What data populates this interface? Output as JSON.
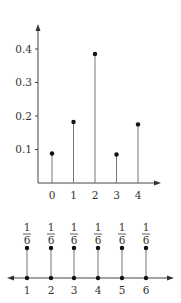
{
  "chart_data": [
    {
      "type": "stem",
      "title": "",
      "xlabel": "",
      "ylabel": "",
      "categories": [
        "0",
        "1",
        "2",
        "3",
        "4"
      ],
      "x": [
        0,
        1,
        2,
        3,
        4
      ],
      "values": [
        0.088,
        0.182,
        0.385,
        0.085,
        0.175
      ],
      "yticks": [
        "0.1",
        "0.2",
        "0.3",
        "0.4"
      ],
      "ytick_values": [
        0.1,
        0.2,
        0.3,
        0.4
      ],
      "ylim": [
        0,
        0.47
      ],
      "grid": false,
      "legend": null
    },
    {
      "type": "stem",
      "title": "",
      "xlabel": "",
      "ylabel": "",
      "categories": [
        "1",
        "2",
        "3",
        "4",
        "5",
        "6"
      ],
      "x": [
        1,
        2,
        3,
        4,
        5,
        6
      ],
      "values": [
        0.1667,
        0.1667,
        0.1667,
        0.1667,
        0.1667,
        0.1667
      ],
      "value_labels": [
        {
          "num": "1",
          "den": "6"
        },
        {
          "num": "1",
          "den": "6"
        },
        {
          "num": "1",
          "den": "6"
        },
        {
          "num": "1",
          "den": "6"
        },
        {
          "num": "1",
          "den": "6"
        },
        {
          "num": "1",
          "den": "6"
        }
      ],
      "axis": "double-arrow number line",
      "grid": false,
      "legend": null
    }
  ],
  "colors": {
    "axis": "#444444",
    "stem": "#777777",
    "point": "#111111",
    "text": "#333333"
  }
}
